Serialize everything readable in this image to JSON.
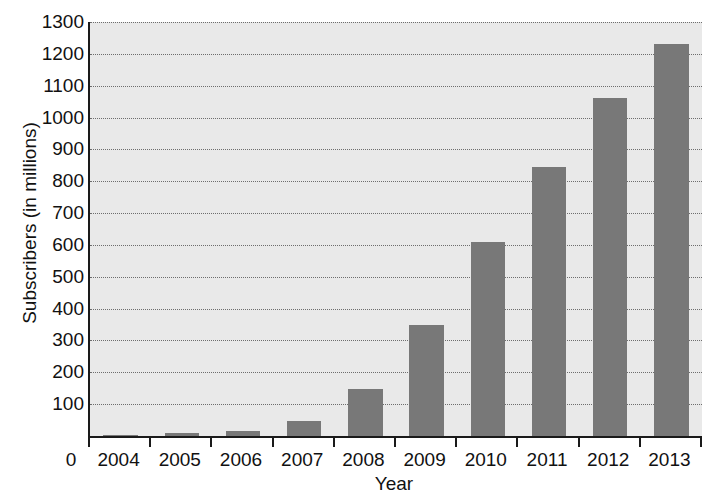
{
  "chart_data": {
    "type": "bar",
    "title": "",
    "xlabel": "Year",
    "ylabel": "Subscribers (in millions)",
    "categories": [
      "2004",
      "2005",
      "2006",
      "2007",
      "2008",
      "2009",
      "2010",
      "2011",
      "2012",
      "2013"
    ],
    "values": [
      2,
      8,
      15,
      48,
      147,
      350,
      610,
      845,
      1060,
      1230
    ],
    "ylim": [
      0,
      1300
    ],
    "ytick_labels": [
      "1300",
      "1200",
      "1100",
      "1000",
      "900",
      "800",
      "700",
      "600",
      "500",
      "400",
      "300",
      "200",
      "100"
    ],
    "ytick_values": [
      1300,
      1200,
      1100,
      1000,
      900,
      800,
      700,
      600,
      500,
      400,
      300,
      200,
      100
    ],
    "origin_label": "0",
    "grid": true,
    "legend": "none",
    "bar_color": "#787878",
    "plot_background": "#e9e9e9",
    "axis_color": "#1a1a1a",
    "gridline_color": "#6d6d6d"
  }
}
